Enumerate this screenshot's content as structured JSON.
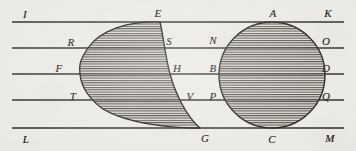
{
  "figure": {
    "type": "geometry-diagram",
    "width": 356,
    "height": 151,
    "background_color": "#eceae6",
    "ink_color": "#26231f",
    "hatch_color": "#3a3631",
    "fill_color": "#d9d6d0"
  },
  "parallel_lines": [
    {
      "id": "line-top",
      "y": 22,
      "x1": 12,
      "x2": 344,
      "left_label": "I",
      "right_label": "K"
    },
    {
      "id": "line-second",
      "y": 48,
      "x1": 12,
      "x2": 344,
      "left_label": "R",
      "right_label": "O"
    },
    {
      "id": "line-middle",
      "y": 74,
      "x1": 12,
      "x2": 344,
      "left_label": "F",
      "right_label": "D"
    },
    {
      "id": "line-fourth",
      "y": 100,
      "x1": 12,
      "x2": 344,
      "left_label": "P",
      "right_label": "Q"
    },
    {
      "id": "line-bottom",
      "y": 128,
      "x1": 12,
      "x2": 344,
      "left_label": "L",
      "right_label": "M"
    }
  ],
  "shapes": {
    "left_region": {
      "name": "hatched-teardrop",
      "description": "Teardrop region with rounded top-left lobe running from E down to a sharp point at G",
      "apex_point": "E",
      "tip_point": "G",
      "path": "M 160 22 C 128 21 100 30 88 48 C 79 61 79 67 80 74 C 81 87 90 100 103 109 C 128 124 172 128 200 128 C 188 118 176 96 170 74 C 165 55 163 34 160 22 Z"
    },
    "right_region": {
      "name": "hatched-circle",
      "description": "Circle tangent to the top line at A and the bottom line at C",
      "center_x": 272,
      "center_y": 75,
      "radius": 53,
      "top_point": "A",
      "bottom_point": "C"
    }
  },
  "labels": [
    {
      "text": "I",
      "x": 25,
      "y": 14,
      "name": "label-I"
    },
    {
      "text": "E",
      "x": 158,
      "y": 13,
      "name": "label-E"
    },
    {
      "text": "A",
      "x": 273,
      "y": 13,
      "name": "label-A"
    },
    {
      "text": "K",
      "x": 328,
      "y": 13,
      "name": "label-K"
    },
    {
      "text": "R",
      "x": 71,
      "y": 42,
      "name": "label-R"
    },
    {
      "text": "S",
      "x": 169,
      "y": 41,
      "name": "label-S"
    },
    {
      "text": "N",
      "x": 213,
      "y": 40,
      "name": "label-N"
    },
    {
      "text": "O",
      "x": 326,
      "y": 41,
      "name": "label-O"
    },
    {
      "text": "F",
      "x": 59,
      "y": 68,
      "name": "label-F"
    },
    {
      "text": "H",
      "x": 177,
      "y": 68,
      "name": "label-H"
    },
    {
      "text": "B",
      "x": 213,
      "y": 68,
      "name": "label-B"
    },
    {
      "text": "D",
      "x": 326,
      "y": 68,
      "name": "label-D"
    },
    {
      "text": "T",
      "x": 73,
      "y": 96,
      "name": "label-T"
    },
    {
      "text": "V",
      "x": 190,
      "y": 96,
      "name": "label-V"
    },
    {
      "text": "P",
      "x": 213,
      "y": 96,
      "name": "label-P"
    },
    {
      "text": "Q",
      "x": 326,
      "y": 96,
      "name": "label-Q"
    },
    {
      "text": "L",
      "x": 26,
      "y": 139,
      "name": "label-L"
    },
    {
      "text": "G",
      "x": 205,
      "y": 138,
      "name": "label-G"
    },
    {
      "text": "C",
      "x": 272,
      "y": 139,
      "name": "label-C"
    },
    {
      "text": "M",
      "x": 330,
      "y": 138,
      "name": "label-M"
    }
  ]
}
